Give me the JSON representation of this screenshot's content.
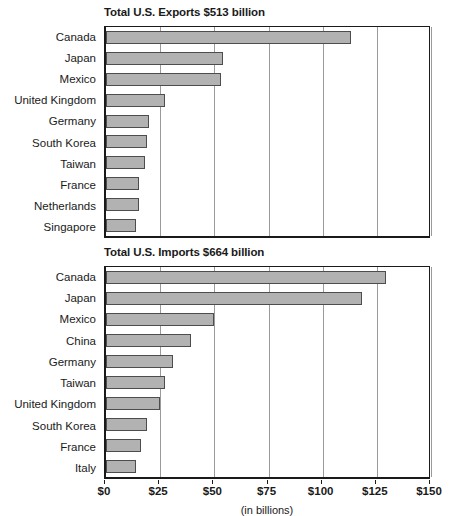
{
  "chart_data": [
    {
      "type": "bar",
      "orientation": "horizontal",
      "id": "exports",
      "title": "Total U.S. Exports $513 billion",
      "xlabel": "(in billions)",
      "ylabel": "",
      "xlim": [
        0,
        150
      ],
      "grid": true,
      "legend": "none",
      "tick_labels": [
        "$0",
        "$25",
        "$50",
        "$75",
        "$100",
        "$125",
        "$150"
      ],
      "ticks": [
        0,
        25,
        50,
        75,
        100,
        125,
        150
      ],
      "categories": [
        "Canada",
        "Japan",
        "Mexico",
        "United Kingdom",
        "Germany",
        "South Korea",
        "Taiwan",
        "France",
        "Netherlands",
        "Singapore"
      ],
      "values": [
        113,
        54,
        53,
        27,
        20,
        19,
        18,
        15,
        15,
        14
      ]
    },
    {
      "type": "bar",
      "orientation": "horizontal",
      "id": "imports",
      "title": "Total U.S. Imports $664 billion",
      "xlabel": "(in billions)",
      "ylabel": "",
      "xlim": [
        0,
        150
      ],
      "grid": true,
      "legend": "none",
      "tick_labels": [
        "$0",
        "$25",
        "$50",
        "$75",
        "$100",
        "$125",
        "$150"
      ],
      "ticks": [
        0,
        25,
        50,
        75,
        100,
        125,
        150
      ],
      "categories": [
        "Canada",
        "Japan",
        "Mexico",
        "China",
        "Germany",
        "Taiwan",
        "United Kingdom",
        "South Korea",
        "France",
        "Italy"
      ],
      "values": [
        129,
        118,
        50,
        39,
        31,
        27,
        25,
        19,
        16,
        14
      ]
    }
  ],
  "axis_caption": "(in billions)",
  "colors": {
    "bar_fill": "#b2b2b2",
    "bar_border": "#4d4d4d",
    "axis": "#1a1a1a",
    "gridline": "#9a9a9a",
    "background": "#ffffff"
  }
}
